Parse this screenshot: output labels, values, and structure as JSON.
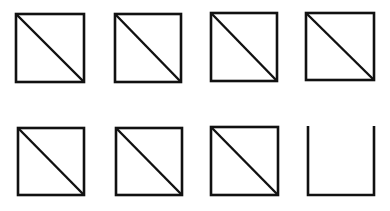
{
  "diagram": {
    "stroke_color": "#111111",
    "background": "#ffffff",
    "rows": [
      {
        "items": [
          {
            "x": 16,
            "y": 14,
            "w": 68,
            "h": 68,
            "type": "square-with-diagonal"
          },
          {
            "x": 115,
            "y": 14,
            "w": 66,
            "h": 68,
            "type": "square-with-diagonal"
          },
          {
            "x": 211,
            "y": 13,
            "w": 66,
            "h": 68,
            "type": "square-with-diagonal"
          },
          {
            "x": 306,
            "y": 13,
            "w": 68,
            "h": 67,
            "type": "square-with-diagonal"
          }
        ]
      },
      {
        "items": [
          {
            "x": 18,
            "y": 128,
            "w": 66,
            "h": 67,
            "type": "square-with-diagonal"
          },
          {
            "x": 116,
            "y": 128,
            "w": 66,
            "h": 67,
            "type": "square-with-diagonal"
          },
          {
            "x": 211,
            "y": 127,
            "w": 67,
            "h": 68,
            "type": "square-with-diagonal"
          },
          {
            "x": 308,
            "y": 126,
            "w": 66,
            "h": 69,
            "type": "open-top-box"
          }
        ]
      }
    ]
  }
}
